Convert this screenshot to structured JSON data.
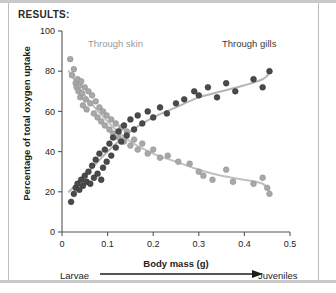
{
  "figure": {
    "section_header": "RESULTS:",
    "stage_axis": {
      "left_label": "Larvae",
      "right_label": "Juveniles",
      "arrow_icon": "right-arrow-icon"
    }
  },
  "chart_data": {
    "type": "scatter",
    "title": "",
    "xlabel": "Body mass (g)",
    "ylabel": "Percentage of total oxygen uptake",
    "xlim": [
      0,
      0.5
    ],
    "ylim": [
      0,
      100
    ],
    "xticks": [
      0,
      0.1,
      0.2,
      0.3,
      0.4,
      0.5
    ],
    "xtick_labels": [
      "0",
      "0.1",
      "0.2",
      "0.3",
      "0.4",
      "0.5"
    ],
    "yticks": [
      0,
      20,
      40,
      60,
      80,
      100
    ],
    "ytick_labels": [
      "0",
      "20",
      "40",
      "60",
      "80",
      "100"
    ],
    "grid": false,
    "legend_position": "in-plot-annotations",
    "series": [
      {
        "name": "Through skin",
        "annotation": "Through skin",
        "color": "#a8a8a8",
        "marker": "circle",
        "trend_color": "#c0c0c0",
        "points": [
          [
            0.018,
            86
          ],
          [
            0.022,
            78
          ],
          [
            0.026,
            81
          ],
          [
            0.03,
            74
          ],
          [
            0.032,
            72
          ],
          [
            0.034,
            76
          ],
          [
            0.036,
            70
          ],
          [
            0.038,
            73
          ],
          [
            0.04,
            67
          ],
          [
            0.042,
            75
          ],
          [
            0.044,
            69
          ],
          [
            0.046,
            63
          ],
          [
            0.05,
            72
          ],
          [
            0.052,
            66
          ],
          [
            0.054,
            61
          ],
          [
            0.058,
            70
          ],
          [
            0.062,
            64
          ],
          [
            0.066,
            68
          ],
          [
            0.07,
            59
          ],
          [
            0.074,
            65
          ],
          [
            0.078,
            57
          ],
          [
            0.082,
            62
          ],
          [
            0.086,
            55
          ],
          [
            0.09,
            60
          ],
          [
            0.094,
            53
          ],
          [
            0.098,
            58
          ],
          [
            0.104,
            51
          ],
          [
            0.108,
            56
          ],
          [
            0.112,
            49
          ],
          [
            0.118,
            54
          ],
          [
            0.124,
            47
          ],
          [
            0.13,
            52
          ],
          [
            0.136,
            45
          ],
          [
            0.142,
            50
          ],
          [
            0.15,
            43
          ],
          [
            0.158,
            46
          ],
          [
            0.166,
            41
          ],
          [
            0.176,
            44
          ],
          [
            0.188,
            39
          ],
          [
            0.2,
            41
          ],
          [
            0.215,
            37
          ],
          [
            0.232,
            38
          ],
          [
            0.255,
            35
          ],
          [
            0.28,
            34
          ],
          [
            0.3,
            30
          ],
          [
            0.31,
            28
          ],
          [
            0.33,
            26
          ],
          [
            0.36,
            31
          ],
          [
            0.375,
            25
          ],
          [
            0.42,
            24
          ],
          [
            0.44,
            27
          ],
          [
            0.45,
            22
          ],
          [
            0.455,
            19
          ]
        ],
        "trend": [
          [
            0.015,
            80
          ],
          [
            0.05,
            68
          ],
          [
            0.1,
            55
          ],
          [
            0.15,
            45
          ],
          [
            0.2,
            39
          ],
          [
            0.25,
            35
          ],
          [
            0.3,
            31
          ],
          [
            0.35,
            28
          ],
          [
            0.4,
            26
          ],
          [
            0.44,
            24
          ],
          [
            0.455,
            20
          ]
        ]
      },
      {
        "name": "Through gills",
        "annotation": "Through gills",
        "color": "#4a4a4a",
        "marker": "circle",
        "trend_color": "#b5b5b5",
        "points": [
          [
            0.02,
            15
          ],
          [
            0.026,
            19
          ],
          [
            0.03,
            22
          ],
          [
            0.034,
            24
          ],
          [
            0.038,
            21
          ],
          [
            0.042,
            26
          ],
          [
            0.046,
            23
          ],
          [
            0.05,
            28
          ],
          [
            0.054,
            25
          ],
          [
            0.058,
            30
          ],
          [
            0.062,
            24
          ],
          [
            0.066,
            33
          ],
          [
            0.07,
            27
          ],
          [
            0.074,
            36
          ],
          [
            0.078,
            29
          ],
          [
            0.082,
            39
          ],
          [
            0.086,
            26
          ],
          [
            0.09,
            32
          ],
          [
            0.094,
            41
          ],
          [
            0.098,
            35
          ],
          [
            0.104,
            44
          ],
          [
            0.108,
            38
          ],
          [
            0.112,
            47
          ],
          [
            0.118,
            42
          ],
          [
            0.124,
            50
          ],
          [
            0.13,
            45
          ],
          [
            0.136,
            53
          ],
          [
            0.142,
            48
          ],
          [
            0.15,
            56
          ],
          [
            0.158,
            51
          ],
          [
            0.166,
            58
          ],
          [
            0.176,
            54
          ],
          [
            0.188,
            60
          ],
          [
            0.2,
            57
          ],
          [
            0.215,
            62
          ],
          [
            0.23,
            59
          ],
          [
            0.25,
            64
          ],
          [
            0.268,
            66
          ],
          [
            0.29,
            70
          ],
          [
            0.3,
            68
          ],
          [
            0.32,
            72
          ],
          [
            0.34,
            67
          ],
          [
            0.36,
            74
          ],
          [
            0.38,
            70
          ],
          [
            0.42,
            76
          ],
          [
            0.44,
            72
          ],
          [
            0.455,
            80
          ]
        ],
        "trend": [
          [
            0.015,
            20
          ],
          [
            0.05,
            28
          ],
          [
            0.1,
            40
          ],
          [
            0.15,
            50
          ],
          [
            0.2,
            57
          ],
          [
            0.25,
            62
          ],
          [
            0.3,
            67
          ],
          [
            0.35,
            70
          ],
          [
            0.4,
            73
          ],
          [
            0.44,
            76
          ],
          [
            0.455,
            79
          ]
        ]
      }
    ]
  }
}
